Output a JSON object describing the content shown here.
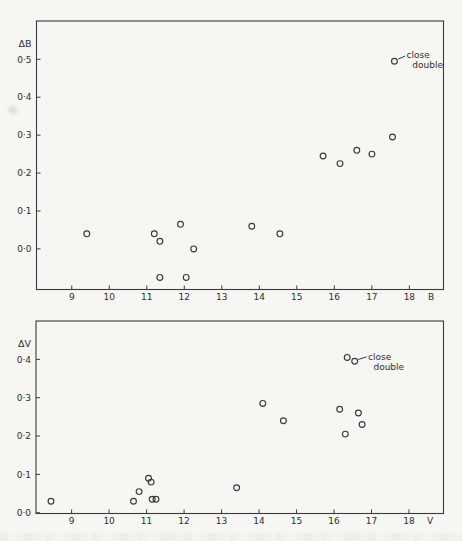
{
  "page": {
    "background_color": "#f6f6f3",
    "ink_color": "#3b3b3b"
  },
  "chart_data": [
    {
      "name": "delta-b-vs-b",
      "type": "scatter",
      "title": "",
      "xlabel": "B",
      "ylabel": "ΔB",
      "grid": false,
      "legend": "none",
      "marker": "open-circle",
      "xlim": [
        8.06,
        18.91
      ],
      "ylim": [
        -0.107,
        0.601
      ],
      "x_ticks": [
        9,
        10,
        11,
        12,
        13,
        14,
        15,
        16,
        17,
        18
      ],
      "y_ticks": [
        {
          "value": 0.5,
          "label": "0·5"
        },
        {
          "value": 0.4,
          "label": "0·4"
        },
        {
          "value": 0.3,
          "label": "0·3"
        },
        {
          "value": 0.2,
          "label": "0·2"
        },
        {
          "value": 0.1,
          "label": "0·1"
        },
        {
          "value": 0.0,
          "label": "0·0"
        }
      ],
      "points": [
        [
          9.4,
          0.04
        ],
        [
          11.2,
          0.04
        ],
        [
          11.35,
          0.02
        ],
        [
          11.9,
          0.065
        ],
        [
          12.25,
          0.0
        ],
        [
          11.35,
          -0.075
        ],
        [
          12.05,
          -0.075
        ],
        [
          13.8,
          0.06
        ],
        [
          14.55,
          0.04
        ],
        [
          15.7,
          0.245
        ],
        [
          16.15,
          0.225
        ],
        [
          16.6,
          0.26
        ],
        [
          17.0,
          0.25
        ],
        [
          17.55,
          0.295
        ]
      ],
      "annotation": {
        "text_lines": [
          "close",
          "double"
        ],
        "points": [
          [
            17.6,
            0.495
          ]
        ]
      }
    },
    {
      "name": "delta-v-vs-v",
      "type": "scatter",
      "title": "",
      "xlabel": "V",
      "ylabel": "ΔV",
      "grid": false,
      "legend": "none",
      "marker": "open-circle",
      "xlim": [
        8.05,
        18.92
      ],
      "ylim": [
        -0.002,
        0.5
      ],
      "x_ticks": [
        9,
        10,
        11,
        12,
        13,
        14,
        15,
        16,
        17,
        18
      ],
      "y_ticks": [
        {
          "value": 0.4,
          "label": "0·4"
        },
        {
          "value": 0.3,
          "label": "0·3"
        },
        {
          "value": 0.2,
          "label": "0·2"
        },
        {
          "value": 0.1,
          "label": "0·1"
        },
        {
          "value": 0.0,
          "label": "0·0"
        }
      ],
      "points": [
        [
          8.45,
          0.03
        ],
        [
          10.65,
          0.03
        ],
        [
          10.8,
          0.055
        ],
        [
          11.05,
          0.09
        ],
        [
          11.12,
          0.08
        ],
        [
          11.15,
          0.035
        ],
        [
          11.25,
          0.035
        ],
        [
          13.4,
          0.065
        ],
        [
          14.1,
          0.285
        ],
        [
          14.65,
          0.24
        ],
        [
          16.15,
          0.27
        ],
        [
          16.3,
          0.205
        ],
        [
          16.65,
          0.26
        ],
        [
          16.75,
          0.23
        ]
      ],
      "annotation": {
        "text_lines": [
          "close",
          "double"
        ],
        "points": [
          [
            16.35,
            0.405
          ],
          [
            16.55,
            0.395
          ]
        ]
      }
    }
  ]
}
